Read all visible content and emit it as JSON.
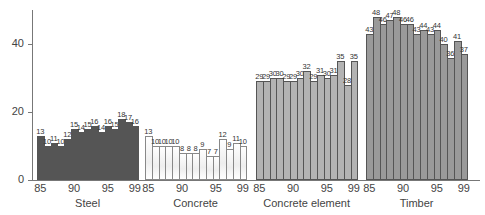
{
  "chart_data": {
    "type": "bar",
    "title": "",
    "xlabel": "",
    "ylabel": "",
    "ylim": [
      0,
      50
    ],
    "yticks": [
      0,
      20,
      40
    ],
    "grid": false,
    "legend": null,
    "groups": [
      {
        "name": "Steel",
        "color": "#555555",
        "years": [
          85,
          86,
          87,
          88,
          89,
          90,
          91,
          92,
          93,
          94,
          95,
          96,
          97,
          98,
          99
        ],
        "tick_labels": [
          "85",
          "90",
          "95",
          "99"
        ],
        "values": [
          13,
          10,
          11,
          10,
          12,
          15,
          14,
          15,
          16,
          14,
          16,
          15,
          18,
          17,
          16
        ]
      },
      {
        "name": "Concrete",
        "color": "#f4f4f4",
        "years": [
          85,
          86,
          87,
          88,
          89,
          90,
          91,
          92,
          93,
          94,
          95,
          96,
          97,
          98,
          99
        ],
        "tick_labels": [
          "85",
          "90",
          "95",
          "99"
        ],
        "values": [
          13,
          10,
          10,
          10,
          10,
          8,
          8,
          8,
          9,
          7,
          7,
          12,
          9,
          11,
          10
        ]
      },
      {
        "name": "Concrete element",
        "color": "#b3b3b3",
        "years": [
          85,
          86,
          87,
          88,
          89,
          90,
          91,
          92,
          93,
          94,
          95,
          96,
          97,
          98,
          99
        ],
        "tick_labels": [
          "85",
          "90",
          "95",
          "99"
        ],
        "values": [
          29,
          29,
          30,
          30,
          29,
          29,
          30,
          32,
          29,
          31,
          30,
          31,
          35,
          28,
          35
        ]
      },
      {
        "name": "Timber",
        "color": "#9a9a9a",
        "years": [
          85,
          86,
          87,
          88,
          89,
          90,
          91,
          92,
          93,
          94,
          95,
          96,
          97,
          98,
          99
        ],
        "tick_labels": [
          "85",
          "90",
          "95",
          "99"
        ],
        "values": [
          43,
          48,
          46,
          47,
          48,
          46,
          46,
          43,
          44,
          43,
          44,
          40,
          36,
          41,
          37
        ]
      }
    ]
  }
}
